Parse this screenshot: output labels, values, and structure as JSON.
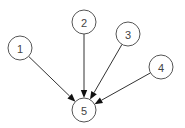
{
  "diagram": {
    "type": "directed-graph",
    "node_radius": 12,
    "nodes": [
      {
        "id": "1",
        "label": "1",
        "x": 20,
        "y": 48
      },
      {
        "id": "2",
        "label": "2",
        "x": 84,
        "y": 22
      },
      {
        "id": "3",
        "label": "3",
        "x": 128,
        "y": 34
      },
      {
        "id": "4",
        "label": "4",
        "x": 161,
        "y": 67
      },
      {
        "id": "5",
        "label": "5",
        "x": 84,
        "y": 110
      }
    ],
    "edges": [
      {
        "from": "1",
        "to": "5"
      },
      {
        "from": "2",
        "to": "5"
      },
      {
        "from": "3",
        "to": "5"
      },
      {
        "from": "4",
        "to": "5"
      }
    ],
    "colors": {
      "node_stroke": "#555555",
      "node_fill": "#ffffff",
      "edge": "#333333",
      "arrowhead": "#111111",
      "label": "#444444"
    }
  }
}
